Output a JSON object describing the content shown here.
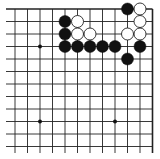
{
  "board": {
    "description": "Go board corner diagram (top-right section)",
    "colors": {
      "background": "#ffffff",
      "line": "#222222",
      "black_stone": "#111111",
      "white_stone": "#ffffff",
      "white_stone_outline": "#222222",
      "star_point": "#111111"
    },
    "grid": {
      "x_lines": [
        15,
        27.5,
        40,
        52.5,
        65,
        77.5,
        90,
        102.5,
        115,
        127.5,
        140,
        152.5
      ],
      "y_lines": [
        9,
        21.5,
        34,
        46.5,
        59,
        71.5,
        84,
        96.5,
        109,
        121.5,
        134,
        146.5
      ],
      "top_edge": true,
      "right_edge": true
    },
    "star_points": [
      {
        "col": 2,
        "row": 3
      },
      {
        "col": 2,
        "row": 9
      },
      {
        "col": 8,
        "row": 9
      }
    ],
    "stones": [
      {
        "color": "black",
        "col": 9,
        "row": 0
      },
      {
        "color": "white",
        "col": 10,
        "row": 0
      },
      {
        "color": "black",
        "col": 4,
        "row": 1
      },
      {
        "color": "white",
        "col": 5,
        "row": 1
      },
      {
        "color": "white",
        "col": 10,
        "row": 1
      },
      {
        "color": "black",
        "col": 4,
        "row": 2
      },
      {
        "color": "white",
        "col": 5,
        "row": 2
      },
      {
        "color": "white",
        "col": 6,
        "row": 2
      },
      {
        "color": "white",
        "col": 9,
        "row": 2
      },
      {
        "color": "white",
        "col": 10,
        "row": 2
      },
      {
        "color": "black",
        "col": 4,
        "row": 3
      },
      {
        "color": "black",
        "col": 5,
        "row": 3
      },
      {
        "color": "black",
        "col": 6,
        "row": 3
      },
      {
        "color": "black",
        "col": 7,
        "row": 3
      },
      {
        "color": "black",
        "col": 8,
        "row": 3
      },
      {
        "color": "black",
        "col": 10,
        "row": 3
      },
      {
        "color": "black",
        "col": 9,
        "row": 4
      }
    ]
  }
}
